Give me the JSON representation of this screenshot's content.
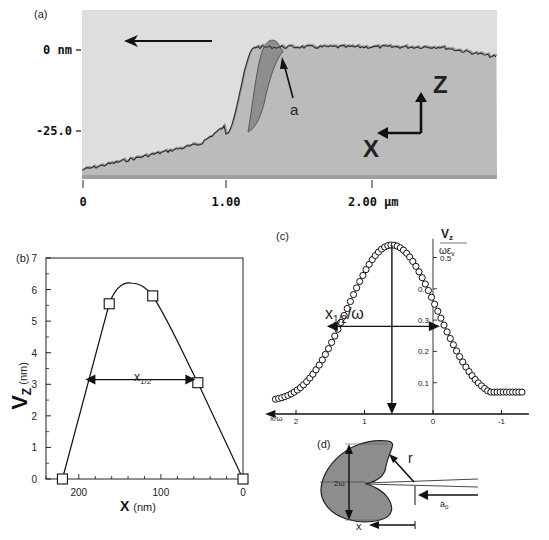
{
  "panel_a": {
    "label": "(a)",
    "y_tick_labels": [
      "0 nm",
      "-25.0"
    ],
    "x_tick_labels": [
      "0",
      "1.00",
      "2.00 μm"
    ],
    "annotation_a": "a",
    "axis_z": "Z",
    "axis_x": "X",
    "scan_direction_icon": "arrow-left-icon",
    "colors": {
      "background": "#dcdcdc",
      "sample": "#b9b9b9",
      "bump": "#8f8f8f",
      "trace": "#333333"
    }
  },
  "chart_data": [
    {
      "type": "line",
      "panel": "(b)",
      "title": "",
      "xlabel": "X (nm)",
      "xlabel_main": "X",
      "xlabel_unit": "(nm)",
      "ylabel": "Vz (nm)",
      "ylabel_main": "V",
      "ylabel_sub": "Z",
      "ylabel_unit": "(nm)",
      "xlim": [
        240,
        0
      ],
      "ylim": [
        0,
        7
      ],
      "x_ticks": [
        200,
        100,
        0
      ],
      "x_tick_labels": [
        "200",
        "100",
        "0"
      ],
      "y_ticks": [
        0,
        1,
        2,
        3,
        4,
        5,
        6,
        7
      ],
      "y_tick_labels": [
        "0",
        "1",
        "2",
        "3",
        "4",
        "5",
        "6",
        "7"
      ],
      "points": [
        {
          "x": 220,
          "y": 0
        },
        {
          "x": 163,
          "y": 5.55
        },
        {
          "x": 110,
          "y": 5.8
        },
        {
          "x": 55,
          "y": 3.05
        },
        {
          "x": 0,
          "y": 0
        }
      ],
      "peak": {
        "x": 135,
        "y": 6.2
      },
      "annotation": {
        "text": "x",
        "sub": "1/2",
        "from_x": 192,
        "to_x": 58,
        "y": 3.15
      }
    },
    {
      "type": "scatter",
      "panel": "(c)",
      "ylabel_num": "V",
      "ylabel_num_sub": "z",
      "ylabel_den": "ωε",
      "ylabel_den_sub": "v",
      "xlabel": "x/ω",
      "xlim": [
        2.4,
        -1.4
      ],
      "ylim": [
        0,
        0.55
      ],
      "x_ticks": [
        2,
        1,
        0,
        -1
      ],
      "x_tick_labels": [
        "2",
        "1",
        "0",
        "-1"
      ],
      "y_ticks": [
        0.1,
        0.2,
        0.3,
        0.4,
        0.5
      ],
      "y_tick_labels": [
        "0.1",
        "0.2",
        "0.3",
        "0.4",
        "0.5"
      ],
      "center_x": 0.6,
      "peak_y": 0.54,
      "half_width_annotation": {
        "text": "x",
        "sub": "1/2",
        "suffix": "/ω",
        "from_x": 1.55,
        "to_x": -0.1,
        "y": 0.28
      },
      "points_x_range": [
        2.3,
        -1.3
      ],
      "point_count": 80
    }
  ],
  "panel_d": {
    "label": "(d)",
    "height_label": "2ω",
    "radius_label": "r",
    "crack_label": "a",
    "crack_label_sub": "0",
    "x_label": "x"
  },
  "panel_b_label": "(b)",
  "panel_c_label": "(c)"
}
